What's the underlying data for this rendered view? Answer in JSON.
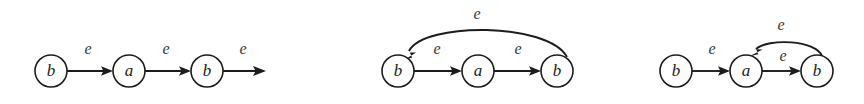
{
  "figure": {
    "background_color": "#ffffff",
    "stroke_color": "#1c1c1c",
    "label_color": "#3a3a3a",
    "width": 864,
    "height": 104
  },
  "diagrams": [
    {
      "id": "diagram-1",
      "caption": "",
      "nodes": [
        {
          "id": "d1-n1",
          "label": "b",
          "cx": 51,
          "cy": 71,
          "r": 16
        },
        {
          "id": "d1-n2",
          "label": "a",
          "cx": 129,
          "cy": 71,
          "r": 16
        },
        {
          "id": "d1-n3",
          "label": "b",
          "cx": 207,
          "cy": 71,
          "r": 16
        }
      ],
      "edges": [
        {
          "id": "d1-e1",
          "label": "e",
          "from": "d1-n1",
          "to": "d1-n2",
          "kind": "straight",
          "label_x": 88,
          "label_y": 50
        },
        {
          "id": "d1-e2",
          "label": "e",
          "from": "d1-n2",
          "to": "d1-n3",
          "kind": "straight",
          "label_x": 166,
          "label_y": 50
        },
        {
          "id": "d1-e3",
          "label": "e",
          "from": "d1-n3",
          "to": "open",
          "kind": "straight-open",
          "label_x": 243,
          "label_y": 50
        }
      ]
    },
    {
      "id": "diagram-2",
      "caption": "",
      "nodes": [
        {
          "id": "d2-n1",
          "label": "b",
          "cx": 398,
          "cy": 71,
          "r": 16
        },
        {
          "id": "d2-n2",
          "label": "a",
          "cx": 478,
          "cy": 71,
          "r": 16
        },
        {
          "id": "d2-n3",
          "label": "b",
          "cx": 557,
          "cy": 71,
          "r": 16
        }
      ],
      "edges": [
        {
          "id": "d2-e1",
          "label": "e",
          "from": "d2-n1",
          "to": "d2-n2",
          "kind": "straight",
          "label_x": 437,
          "label_y": 50
        },
        {
          "id": "d2-e2",
          "label": "e",
          "from": "d2-n2",
          "to": "d2-n3",
          "kind": "straight",
          "label_x": 518,
          "label_y": 50
        },
        {
          "id": "d2-e3",
          "label": "e",
          "from": "d2-n3",
          "to": "d2-n1",
          "kind": "arc-over-large",
          "label_x": 477,
          "label_y": 15
        }
      ]
    },
    {
      "id": "diagram-3",
      "caption": "",
      "nodes": [
        {
          "id": "d3-n1",
          "label": "b",
          "cx": 676,
          "cy": 71,
          "r": 16
        },
        {
          "id": "d3-n2",
          "label": "a",
          "cx": 746,
          "cy": 71,
          "r": 16
        },
        {
          "id": "d3-n3",
          "label": "b",
          "cx": 817,
          "cy": 71,
          "r": 16
        }
      ],
      "edges": [
        {
          "id": "d3-e1",
          "label": "e",
          "from": "d3-n1",
          "to": "d3-n2",
          "kind": "straight",
          "label_x": 712,
          "label_y": 50
        },
        {
          "id": "d3-e2",
          "label": "e",
          "from": "d3-n2",
          "to": "d3-n3",
          "kind": "straight",
          "label_x": 783,
          "label_y": 57
        },
        {
          "id": "d3-e3",
          "label": "e",
          "from": "d3-n3",
          "to": "d3-n2",
          "kind": "arc-over-small",
          "label_x": 781,
          "label_y": 26
        }
      ]
    }
  ],
  "labels": {
    "d1_n1": "b",
    "d1_n2": "a",
    "d1_n3": "b",
    "d1_e1": "e",
    "d1_e2": "e",
    "d1_e3": "e",
    "d2_n1": "b",
    "d2_n2": "a",
    "d2_n3": "b",
    "d2_e1": "e",
    "d2_e2": "e",
    "d2_e3": "e",
    "d3_n1": "b",
    "d3_n2": "a",
    "d3_n3": "b",
    "d3_e1": "e",
    "d3_e2": "e",
    "d3_e3": "e"
  }
}
